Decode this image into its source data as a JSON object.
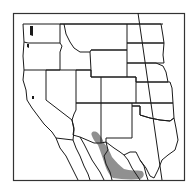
{
  "map": {
    "type": "species-range-map",
    "region": "Western United States and northern Mexico",
    "colors": {
      "background": "#ffffff",
      "borders": "#1a1a1a",
      "range_fill": "#8a8a8a",
      "frame": "#333333"
    },
    "legend": [],
    "labels": []
  }
}
